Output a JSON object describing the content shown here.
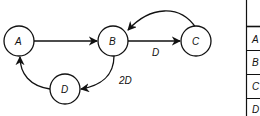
{
  "graph": {
    "nodes": [
      {
        "id": "A",
        "label": "A"
      },
      {
        "id": "B",
        "label": "B"
      },
      {
        "id": "C",
        "label": "C"
      },
      {
        "id": "D",
        "label": "D"
      }
    ],
    "edges": [
      {
        "from": "A",
        "to": "B",
        "label": ""
      },
      {
        "from": "B",
        "to": "C",
        "label": "D"
      },
      {
        "from": "C",
        "to": "B",
        "label": ""
      },
      {
        "from": "B",
        "to": "D",
        "label": "2D"
      },
      {
        "from": "D",
        "to": "A",
        "label": ""
      }
    ]
  },
  "table": {
    "row_labels": [
      "A",
      "B",
      "C",
      "D"
    ]
  }
}
